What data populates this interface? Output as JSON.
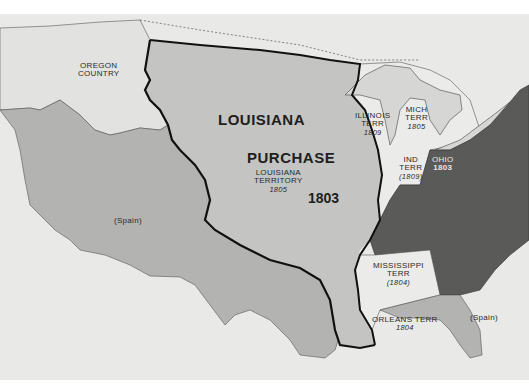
{
  "map": {
    "title": "Louisiana Purchase 1803",
    "colors": {
      "background": "#e9e9e7",
      "louisiana_purchase": "#c4c4c2",
      "spain": "#b0b0ae",
      "territories": "#ececea",
      "states": "#5a5a58",
      "lakes": "#d6d6d4",
      "boundary": "#111111"
    },
    "labels": {
      "oregon": [
        "OREGON",
        "COUNTRY"
      ],
      "louisiana_purchase": [
        "LOUISIANA",
        "PURCHASE"
      ],
      "louisiana_territory": [
        "LOUISIANA",
        "TERRITORY"
      ],
      "louisiana_territory_year": "1805",
      "purchase_year": "1803",
      "illinois": [
        "ILLINOIS",
        "TERR"
      ],
      "illinois_year": "1809",
      "michigan": [
        "MICH",
        "TERR"
      ],
      "michigan_year": "1805",
      "indiana": [
        "IND",
        "TERR"
      ],
      "indiana_year": "(1809)",
      "ohio": "OHIO",
      "ohio_year": "1803",
      "mississippi": [
        "MISSISSIPPI",
        "TERR"
      ],
      "mississippi_year": "(1804)",
      "orleans": "ORLEANS TERR",
      "orleans_year": "1804",
      "spain_west": "(Spain)",
      "spain_florida": "(Spain)"
    }
  }
}
